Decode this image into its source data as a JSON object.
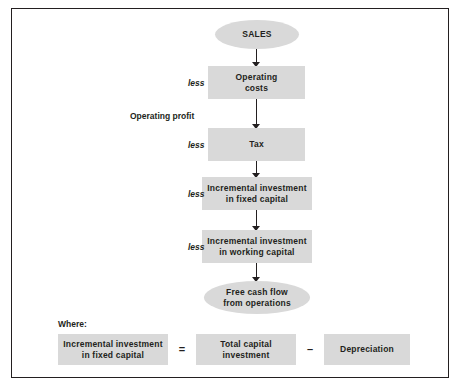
{
  "diagram": {
    "title_node": "SALES",
    "flow_nodes": [
      {
        "line1": "Operating",
        "line2": "costs"
      },
      {
        "line1": "Tax",
        "line2": ""
      },
      {
        "line1": "Incremental investment",
        "line2": "in fixed capital"
      },
      {
        "line1": "Incremental investment",
        "line2": "in working capital"
      }
    ],
    "result_node": {
      "line1": "Free cash flow",
      "line2": "from operations"
    },
    "side_labels": {
      "less1": "less",
      "less2": "less",
      "less3": "less",
      "less4": "less",
      "operating_profit": "Operating profit"
    },
    "where": {
      "label": "Where:",
      "term1": {
        "line1": "Incremental investment",
        "line2": "in fixed capital"
      },
      "equals": "=",
      "term2": {
        "line1": "Total capital",
        "line2": "investment"
      },
      "minus": "–",
      "term3": {
        "line1": "Depreciation",
        "line2": ""
      }
    },
    "colors": {
      "node_fill": "#d9d9d9",
      "text": "#231f20",
      "border": "#231f20"
    }
  }
}
